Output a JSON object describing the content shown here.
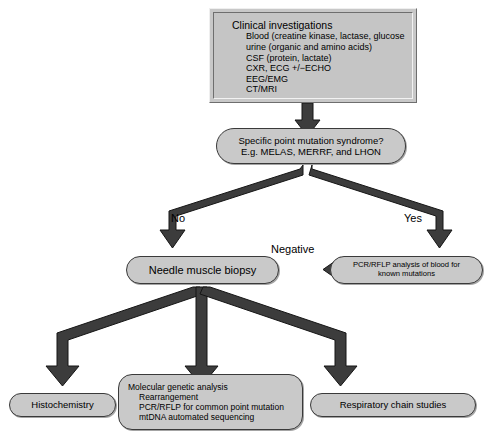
{
  "figure": {
    "type": "flowchart"
  },
  "nodes": {
    "clinical_investigations": {
      "heading": "Clinical investigations",
      "lines": [
        "Blood (creatine kinase, lactase, glucose",
        "urine (organic and amino acids)",
        "CSF (protein, lactate)",
        "CXR, ECG +/−ECHO",
        "EEG/EMG",
        "CT/MRI"
      ]
    },
    "point_mutation": {
      "line1": "Specific point mutation syndrome?",
      "line2": "E.g. MELAS, MERRF, and LHON"
    },
    "needle_biopsy": {
      "label": "Needle muscle biopsy"
    },
    "pcr_rflp_blood": {
      "line1": "PCR/RFLP analysis of blood for",
      "line2": "known mutations"
    },
    "histochemistry": {
      "label": "Histochemistry"
    },
    "molecular_genetic": {
      "heading": "Molecular genetic analysis",
      "lines": [
        "Rearrangement",
        "PCR/RFLP for common point mutation",
        "mtDNA automated sequencing"
      ]
    },
    "respiratory_chain": {
      "label": "Respiratory chain studies"
    }
  },
  "edge_labels": {
    "no": "No",
    "yes": "Yes",
    "negative": "Negative"
  },
  "colors": {
    "box_fill": "#c8c8c8",
    "arrow_fill": "#3c3c3c",
    "arrow_stroke": "#111111",
    "text": "#000000",
    "page_background": "#ffffff"
  }
}
